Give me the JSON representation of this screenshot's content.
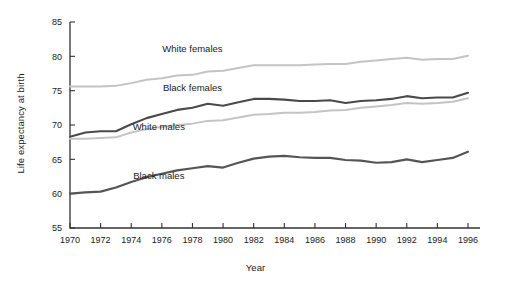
{
  "chart_data": {
    "type": "line",
    "title": "",
    "xlabel": "Year",
    "ylabel": "Life expectancy at birth",
    "xlim": [
      1970,
      1996
    ],
    "ylim": [
      55,
      85
    ],
    "grid": false,
    "legend_position": "inline-annotations",
    "x": [
      1970,
      1971,
      1972,
      1973,
      1974,
      1975,
      1976,
      1977,
      1978,
      1979,
      1980,
      1981,
      1982,
      1983,
      1984,
      1985,
      1986,
      1987,
      1988,
      1989,
      1990,
      1991,
      1992,
      1993,
      1994,
      1995,
      1996
    ],
    "xtick_labels": [
      "1970",
      "1972",
      "1974",
      "1976",
      "1978",
      "1980",
      "1982",
      "1984",
      "1986",
      "1988",
      "1990",
      "1992",
      "1994",
      "1996"
    ],
    "xticks": [
      1970,
      1972,
      1974,
      1976,
      1978,
      1980,
      1982,
      1984,
      1986,
      1988,
      1990,
      1992,
      1994,
      1996
    ],
    "ytick_labels": [
      "55",
      "60",
      "65",
      "70",
      "75",
      "80",
      "85"
    ],
    "yticks": [
      55,
      60,
      65,
      70,
      75,
      80,
      85
    ],
    "series": [
      {
        "name": "White females",
        "color": "#c4c4c4",
        "width": 2.0,
        "label_x": 1978.0,
        "label_y": 80.6,
        "values": [
          75.6,
          75.6,
          75.6,
          75.7,
          76.1,
          76.6,
          76.8,
          77.2,
          77.3,
          77.8,
          77.9,
          78.3,
          78.7,
          78.7,
          78.7,
          78.7,
          78.8,
          78.9,
          78.9,
          79.2,
          79.4,
          79.6,
          79.8,
          79.5,
          79.6,
          79.6,
          80.1
        ]
      },
      {
        "name": "Black females",
        "color": "#4a4a4a",
        "width": 2.1,
        "label_x": 1978.0,
        "label_y": 74.9,
        "values": [
          68.3,
          68.9,
          69.1,
          69.1,
          70.1,
          71.0,
          71.6,
          72.2,
          72.5,
          73.1,
          72.8,
          73.3,
          73.8,
          73.8,
          73.7,
          73.5,
          73.5,
          73.6,
          73.2,
          73.5,
          73.6,
          73.8,
          74.2,
          73.9,
          74.0,
          74.0,
          74.7
        ]
      },
      {
        "name": "White males",
        "color": "#c4c4c4",
        "width": 2.0,
        "label_x": 1975.8,
        "label_y": 69.3,
        "values": [
          68.0,
          68.0,
          68.1,
          68.2,
          68.9,
          69.4,
          69.7,
          70.0,
          70.2,
          70.6,
          70.7,
          71.1,
          71.5,
          71.6,
          71.8,
          71.8,
          71.9,
          72.1,
          72.2,
          72.5,
          72.7,
          72.9,
          73.2,
          73.1,
          73.2,
          73.4,
          73.9
        ]
      },
      {
        "name": "Black males",
        "color": "#555555",
        "width": 2.2,
        "label_x": 1975.8,
        "label_y": 62.2,
        "values": [
          60.0,
          60.2,
          60.3,
          60.9,
          61.7,
          62.4,
          62.9,
          63.4,
          63.7,
          64.0,
          63.8,
          64.5,
          65.1,
          65.4,
          65.5,
          65.3,
          65.2,
          65.2,
          64.9,
          64.8,
          64.5,
          64.6,
          65.0,
          64.6,
          64.9,
          65.2,
          66.1
        ]
      }
    ]
  },
  "axes": {
    "y_title": "Life expectancy at birth",
    "x_title": "Year"
  }
}
